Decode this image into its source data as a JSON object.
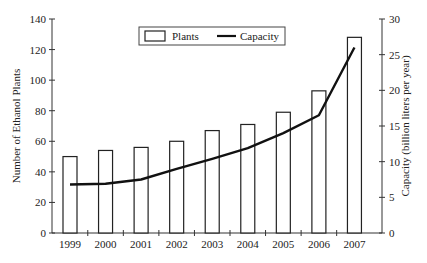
{
  "chart_data": {
    "type": "bar",
    "title": "",
    "categories": [
      "1999",
      "2000",
      "2001",
      "2002",
      "2003",
      "2004",
      "2005",
      "2006",
      "2007"
    ],
    "series": [
      {
        "name": "Plants",
        "type": "bar",
        "axis": "left",
        "values": [
          50,
          54,
          56,
          60,
          67,
          71,
          79,
          93,
          128
        ]
      },
      {
        "name": "Capacity",
        "type": "line",
        "axis": "right",
        "values": [
          6.8,
          6.9,
          7.5,
          9.0,
          10.4,
          11.9,
          14.0,
          16.5,
          26.0
        ]
      }
    ],
    "xlabel": "",
    "ylabel": "Number of Ethanol Plants",
    "ylabel_right": "Capacity (billion liters per year)",
    "ylim": [
      0,
      140
    ],
    "ylim_right": [
      0,
      30
    ],
    "yticks": [
      "0",
      "20",
      "40",
      "60",
      "80",
      "100",
      "120",
      "140"
    ],
    "yticks_right": [
      "0",
      "5",
      "10",
      "15",
      "20",
      "25",
      "30"
    ],
    "legend": {
      "position": "top-center",
      "entries": [
        "Plants",
        "Capacity"
      ]
    },
    "grid": false
  },
  "legend": {
    "plants_label": "Plants",
    "capacity_label": "Capacity"
  },
  "axes": {
    "left_label": "Number of Ethanol Plants",
    "right_label": "Capacity (billion liters per year)"
  }
}
